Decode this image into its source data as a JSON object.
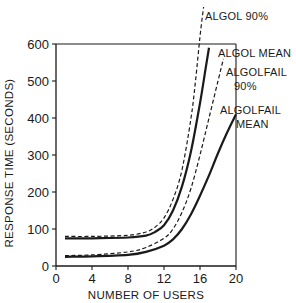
{
  "chart_data": {
    "type": "line",
    "title": "",
    "xlabel": "NUMBER OF USERS",
    "ylabel": "RESPONSE TIME (SECONDS)",
    "xlim": [
      0,
      20
    ],
    "ylim": [
      0,
      600
    ],
    "xticks": [
      0,
      4,
      8,
      12,
      16,
      20
    ],
    "yticks": [
      0,
      100,
      200,
      300,
      400,
      500,
      600
    ],
    "xtick_labels": [
      "0",
      "4",
      "8",
      "12",
      "16",
      "20"
    ],
    "ytick_labels": [
      "0",
      "100",
      "200",
      "300",
      "400",
      "500",
      "600"
    ],
    "grid": false,
    "legend": "none (direct annotations at top-right)",
    "series": [
      {
        "name": "ALGOL 90%",
        "style": "dashed",
        "x": [
          1,
          4,
          8,
          10,
          11,
          12,
          13,
          14,
          15,
          15.5,
          16,
          16.4
        ],
        "y": [
          80,
          80,
          83,
          92,
          105,
          130,
          180,
          260,
          400,
          500,
          620,
          700
        ]
      },
      {
        "name": "ALGOL MEAN",
        "style": "solid",
        "x": [
          1,
          4,
          8,
          10,
          11,
          12,
          13,
          14,
          15,
          16,
          16.6,
          17
        ],
        "y": [
          75,
          75,
          77,
          82,
          92,
          110,
          150,
          215,
          310,
          440,
          530,
          590
        ]
      },
      {
        "name": "ALGOLFAIL 90%",
        "style": "dashed",
        "x": [
          1,
          4,
          8,
          10,
          12,
          13,
          14,
          15,
          16,
          17,
          18,
          18.6
        ],
        "y": [
          28,
          30,
          38,
          50,
          75,
          100,
          145,
          210,
          300,
          400,
          500,
          560
        ]
      },
      {
        "name": "ALGOLFAIL MEAN",
        "style": "solid",
        "x": [
          1,
          4,
          8,
          10,
          12,
          13,
          14,
          15,
          16,
          17,
          18,
          19,
          20
        ],
        "y": [
          25,
          26,
          30,
          38,
          55,
          72,
          100,
          140,
          190,
          245,
          305,
          360,
          410
        ]
      }
    ],
    "annotations": [
      {
        "text": "ALGOL 90%",
        "lines": [
          "ALGOL 90%"
        ],
        "series": "ALGOL 90%"
      },
      {
        "text": "ALGOL MEAN",
        "lines": [
          "ALGOL MEAN"
        ],
        "series": "ALGOL MEAN"
      },
      {
        "text": "ALGOLFAIL 90%",
        "lines": [
          "ALGOLFAIL",
          "90%"
        ],
        "series": "ALGOLFAIL 90%"
      },
      {
        "text": "ALGOLFAIL MEAN",
        "lines": [
          "ALGOLFAIL",
          "MEAN"
        ],
        "series": "ALGOLFAIL MEAN"
      }
    ],
    "colors": {
      "ink": "#1a1a1a",
      "background": "#ffffff"
    }
  }
}
